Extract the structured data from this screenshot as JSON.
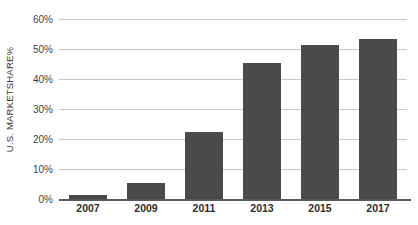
{
  "chart_data": {
    "type": "bar",
    "title": "",
    "subtitle": "",
    "xlabel": "",
    "ylabel": "U.S. MARKETSHARE%",
    "categories": [
      "2007",
      "2009",
      "2011",
      "2013",
      "2015",
      "2017"
    ],
    "values": [
      1.3,
      5.2,
      22.3,
      45.2,
      51.5,
      53.3
    ],
    "series": [
      {
        "name": "U.S. Marketshare",
        "values": [
          1.3,
          5.2,
          22.3,
          45.2,
          51.5,
          53.3
        ]
      }
    ],
    "ylim": [
      0,
      60
    ],
    "xlim_categories": 6,
    "y_ticks": [
      0,
      10,
      20,
      30,
      40,
      50,
      60
    ],
    "y_tick_labels": [
      "0%",
      "10%",
      "20%",
      "30%",
      "40%",
      "50%",
      "60%"
    ],
    "grid": true,
    "grid_axis": "y",
    "legend": false,
    "legend_position": "none",
    "bar_color": "#4a4a4a",
    "gridline_color": "#c8c8c8",
    "axis_color": "#5a5a5a",
    "background_color": "#ffffff",
    "text_color": "#3a3a3a",
    "annotations": []
  }
}
